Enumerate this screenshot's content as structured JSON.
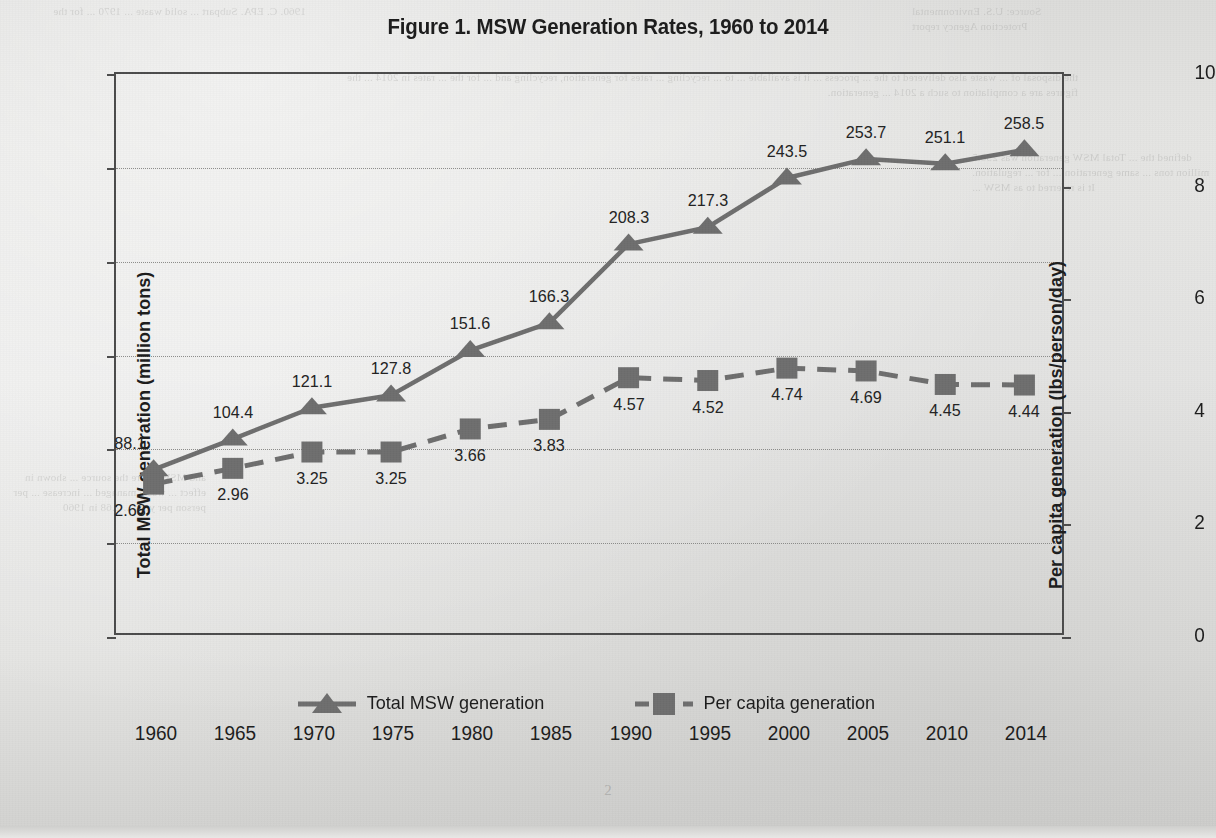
{
  "title": "Figure 1. MSW Generation Rates, 1960 to 2014",
  "page_number": "2",
  "colors": {
    "series": "#6e6e6e",
    "frame": "#4b4b4b",
    "text": "#1c1c1c",
    "grid": "#8d8d8b",
    "paper": "#e6e6e4"
  },
  "legend": {
    "items": [
      {
        "label": "Total MSW generation",
        "marker": "triangle-marker"
      },
      {
        "label": "Per capita generation",
        "marker": "square-marker"
      }
    ]
  },
  "bleed_text": {
    "top_left": "1960. C. EPA. Subpart ... solid waste ... 1970 ... for the",
    "top_right": "Source: U.S. Environmental\nProtection Agency report",
    "middle": "the disposal of ... waste also delivered to the ... process ... it is available ... to ... recycling ... rates for generation, recycling and ... for the ... rates in 2014 ... the figures are a compilation to such a 2014 ... generation.",
    "right_2": "defined the ... Total MSW generation was 258.5 million tons ... same generation ... for ... regulation. It is referred to as MSW ...",
    "bottom_left": "and MSW ... are the source ... shown in effect ... waste managed ... increase ... per person per year ... 2.68 in 1960"
  },
  "chart_data": {
    "type": "line",
    "title": "Figure 1. MSW Generation Rates, 1960 to 2014",
    "xlabel": "",
    "categories": [
      "1960",
      "1965",
      "1970",
      "1975",
      "1980",
      "1985",
      "1990",
      "1995",
      "2000",
      "2005",
      "2010",
      "2014"
    ],
    "grid": true,
    "legend_position": "bottom",
    "axes": {
      "left": {
        "label": "Total MSW generation (million tons)",
        "ticks": [
          0,
          50,
          100,
          150,
          200,
          250,
          300
        ],
        "lim": [
          0,
          300
        ]
      },
      "right": {
        "label": "Per capita generation (lbs/person/day)",
        "ticks": [
          0,
          2,
          4,
          6,
          8,
          10
        ],
        "lim": [
          0,
          10
        ]
      }
    },
    "series": [
      {
        "name": "Total MSW generation",
        "axis": "left",
        "marker": "triangle",
        "linestyle": "solid",
        "values": [
          88.1,
          104.4,
          121.1,
          127.8,
          151.6,
          166.3,
          208.3,
          217.3,
          243.5,
          253.7,
          251.1,
          258.5
        ],
        "labels": [
          "88.1",
          "104.4",
          "121.1",
          "127.8",
          "151.6",
          "166.3",
          "208.3",
          "217.3",
          "243.5",
          "253.7",
          "251.1",
          "258.5"
        ],
        "label_positions": [
          "above-left",
          "above",
          "above",
          "above",
          "above",
          "above",
          "above",
          "above",
          "above",
          "above",
          "above",
          "above"
        ]
      },
      {
        "name": "Per capita generation",
        "axis": "right",
        "marker": "square",
        "linestyle": "dashed",
        "values": [
          2.68,
          2.96,
          3.25,
          3.25,
          3.66,
          3.83,
          4.57,
          4.52,
          4.74,
          4.69,
          4.45,
          4.44
        ],
        "labels": [
          "2.68",
          "2.96",
          "3.25",
          "3.25",
          "3.66",
          "3.83",
          "4.57",
          "4.52",
          "4.74",
          "4.69",
          "4.45",
          "4.44"
        ],
        "label_positions": [
          "below-left",
          "below",
          "below",
          "below",
          "below",
          "below",
          "below",
          "below",
          "below",
          "below",
          "below",
          "below"
        ]
      }
    ]
  }
}
